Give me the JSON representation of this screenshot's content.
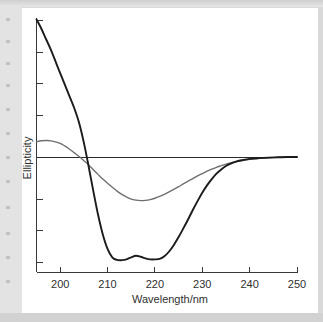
{
  "figure": {
    "background_color": "#ffffff",
    "page_color": "#d9d9d9"
  },
  "chart_data": {
    "type": "line",
    "title": "",
    "xlabel": "Wavelength/nm",
    "ylabel": "Ellipticity",
    "xlim": [
      195,
      250
    ],
    "ylim": [
      -4.4,
      5.3
    ],
    "grid": false,
    "legend_position": "none",
    "x_ticks": [
      200,
      210,
      220,
      230,
      240,
      250
    ],
    "x_tick_labels": [
      "200",
      "210",
      "220",
      "230",
      "240",
      "250"
    ],
    "y_ticks": [
      5.2,
      4.0,
      2.8,
      1.6,
      0.0,
      -1.6,
      -2.8,
      -4.0
    ],
    "y_tick_labels": [
      "",
      "",
      "",
      "",
      "",
      "",
      "",
      ""
    ],
    "baseline_value": 0,
    "x": [
      195,
      196,
      197,
      198,
      200,
      202,
      203,
      204,
      205,
      206,
      207,
      208,
      209,
      210,
      211,
      212,
      213,
      214,
      215,
      216,
      217,
      218,
      219,
      220,
      221,
      222,
      223,
      224,
      225,
      226,
      227,
      228,
      229,
      230,
      231,
      232,
      233,
      234,
      235,
      236,
      237,
      238,
      240,
      242,
      244,
      246,
      248,
      250
    ],
    "series": [
      {
        "name": "alpha-helix",
        "color": "#1b1b1b",
        "linewidth": 1.9,
        "values": [
          5.25,
          4.9,
          4.5,
          4.1,
          3.2,
          2.3,
          1.85,
          1.3,
          0.55,
          -0.35,
          -1.3,
          -2.2,
          -2.95,
          -3.5,
          -3.82,
          -3.92,
          -3.93,
          -3.9,
          -3.82,
          -3.76,
          -3.8,
          -3.86,
          -3.9,
          -3.9,
          -3.88,
          -3.78,
          -3.6,
          -3.35,
          -3.05,
          -2.72,
          -2.38,
          -2.02,
          -1.68,
          -1.36,
          -1.08,
          -0.84,
          -0.63,
          -0.47,
          -0.34,
          -0.25,
          -0.18,
          -0.13,
          -0.07,
          -0.04,
          -0.02,
          -0.01,
          0.0,
          0.0
        ]
      },
      {
        "name": "beta-sheet",
        "color": "#6e6e6e",
        "linewidth": 1.35,
        "values": [
          0.58,
          0.62,
          0.63,
          0.62,
          0.52,
          0.3,
          0.16,
          0.02,
          -0.14,
          -0.3,
          -0.48,
          -0.66,
          -0.84,
          -1.0,
          -1.15,
          -1.3,
          -1.42,
          -1.52,
          -1.6,
          -1.64,
          -1.66,
          -1.65,
          -1.62,
          -1.57,
          -1.5,
          -1.42,
          -1.33,
          -1.23,
          -1.13,
          -1.02,
          -0.92,
          -0.82,
          -0.72,
          -0.63,
          -0.54,
          -0.46,
          -0.39,
          -0.33,
          -0.27,
          -0.22,
          -0.18,
          -0.15,
          -0.09,
          -0.05,
          -0.03,
          -0.015,
          -0.005,
          0.0
        ]
      }
    ]
  }
}
